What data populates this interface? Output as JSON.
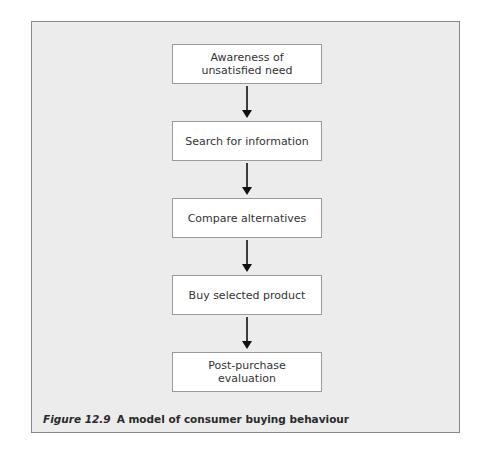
{
  "diagram": {
    "type": "flowchart",
    "direction": "top-to-bottom",
    "steps": [
      {
        "label": "Awareness of unsatisfied need"
      },
      {
        "label": "Search for information"
      },
      {
        "label": "Compare alternatives"
      },
      {
        "label": "Buy selected product"
      },
      {
        "label": "Post-purchase evaluation"
      }
    ],
    "connectors": [
      {
        "from": 0,
        "to": 1,
        "icon": "arrow-down-icon"
      },
      {
        "from": 1,
        "to": 2,
        "icon": "arrow-down-icon"
      },
      {
        "from": 2,
        "to": 3,
        "icon": "arrow-down-icon"
      },
      {
        "from": 3,
        "to": 4,
        "icon": "arrow-down-icon"
      }
    ]
  },
  "caption": {
    "figure_number": "Figure 12.9",
    "title": "A model of consumer buying behaviour"
  },
  "colors": {
    "panel_background": "#ececec",
    "box_background": "#ffffff",
    "border": "#8a8a8a",
    "arrow": "#111111"
  }
}
